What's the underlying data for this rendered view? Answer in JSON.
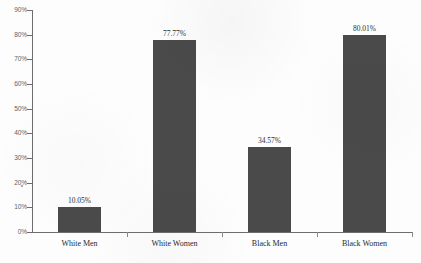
{
  "chart_data": {
    "type": "bar",
    "title": "",
    "subtitle": "",
    "xlabel": "",
    "ylabel": "",
    "categories": [
      "White Men",
      "White Women",
      "Black Men",
      "Black Women"
    ],
    "values": [
      10.05,
      77.77,
      34.57,
      80.01
    ],
    "value_labels": [
      "10.05%",
      "77.77%",
      "34.57%",
      "80.01%"
    ],
    "ylim": [
      0,
      90
    ],
    "y_ticks": [
      0,
      10,
      20,
      30,
      40,
      50,
      60,
      70,
      80,
      90
    ],
    "y_tick_labels": [
      "0%",
      "10%",
      "20%",
      "30%",
      "40%",
      "50%",
      "60%",
      "70%",
      "80%",
      "90%"
    ],
    "grid": false,
    "legend": false,
    "legend_position": "none",
    "bar_color": "#4a4a4a",
    "axis_color": "#6d6d6d",
    "background_color": "#fdfdfd"
  }
}
